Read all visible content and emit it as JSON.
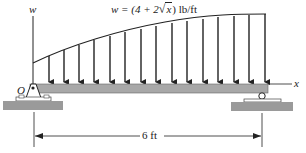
{
  "diagram": {
    "load_equation": "w = (4 + 2√x) lb/ft",
    "load_equation_prefix": "w = (4 + 2",
    "load_equation_sqrt_arg": "x",
    "load_equation_suffix": ") lb/ft",
    "axis_w_label": "w",
    "axis_x_label": "x",
    "origin_label": "O",
    "span_label": "6 ft",
    "beam": {
      "start_x": 30,
      "end_x": 268,
      "top_y": 84,
      "bottom_y": 93,
      "color": "#a8a8a8"
    },
    "load_arrows_x": [
      49,
      64,
      79,
      94,
      110,
      125,
      141,
      156,
      172,
      187,
      203,
      218,
      234,
      249,
      265
    ],
    "supports": [
      {
        "type": "pin",
        "x": 33,
        "label": "O"
      },
      {
        "type": "roller",
        "x": 266
      }
    ],
    "colors": {
      "line": "#222222",
      "beam": "#a8a8a8",
      "ground": "#9a9a9a"
    }
  }
}
